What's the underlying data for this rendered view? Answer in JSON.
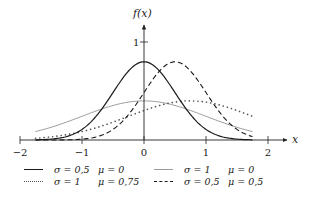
{
  "chart_data": {
    "type": "line",
    "title": "",
    "xlabel": "x",
    "ylabel": "f(x)",
    "xlim": [
      -2,
      2.3
    ],
    "ylim": [
      0,
      1.15
    ],
    "x_ticks": [
      -2,
      -1,
      0,
      1,
      2
    ],
    "x_tick_labels": [
      "−2",
      "−1",
      "0",
      "1",
      "2"
    ],
    "y_ticks": [
      1
    ],
    "y_tick_labels": [
      "1"
    ],
    "grid": false,
    "legend_position": "bottom",
    "x_range": [
      -1.75,
      1.75
    ],
    "series": [
      {
        "name": "σ = 0,5   μ = 0",
        "sigma": 0.5,
        "mu": 0,
        "style": "solid",
        "color": "#1a1a1a",
        "width": 1.2,
        "legend_sigma": "σ = 0,5",
        "legend_mu": "μ = 0"
      },
      {
        "name": "σ = 1   μ = 0",
        "sigma": 1,
        "mu": 0,
        "style": "solid",
        "color": "#9a9a9a",
        "width": 1.0,
        "legend_sigma": "σ = 1",
        "legend_mu": "μ = 0"
      },
      {
        "name": "σ = 1   μ = 0,75",
        "sigma": 1,
        "mu": 0.75,
        "style": "dotted",
        "color": "#555555",
        "width": 1.6,
        "legend_sigma": "σ = 1",
        "legend_mu": "μ = 0,75"
      },
      {
        "name": "σ = 0,5   μ = 0,5",
        "sigma": 0.5,
        "mu": 0.5,
        "style": "dashed",
        "color": "#1a1a1a",
        "width": 1.1,
        "legend_sigma": "σ = 0,5",
        "legend_mu": "μ = 0,5"
      }
    ]
  },
  "legend": {
    "items": [
      {
        "sigma": "σ = 0,5",
        "mu": "μ = 0"
      },
      {
        "sigma": "σ = 1",
        "mu": "μ = 0"
      },
      {
        "sigma": "σ = 1",
        "mu": "μ = 0,75"
      },
      {
        "sigma": "σ = 0,5",
        "mu": "μ = 0,5"
      }
    ]
  },
  "axes": {
    "x_label": "x",
    "y_label": "f(x)",
    "x_tick_labels": [
      "−2",
      "−1",
      "0",
      "1",
      "2"
    ],
    "y_tick_label": "1"
  }
}
